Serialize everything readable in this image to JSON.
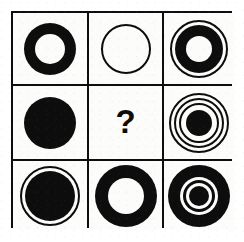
{
  "puzzle": {
    "title": "Matrix Reasoning Puzzle",
    "grid": {
      "rows": 3,
      "columns": 3
    },
    "missing_cell_index": 4,
    "missing_marker": "?",
    "colors": {
      "ink": "#0d0d0d",
      "paper": "#fcfcfa",
      "border": "#0d0d0d"
    },
    "cells": [
      {
        "index": 0,
        "row": 1,
        "column": 1,
        "name": "thick-ring",
        "description": "Thick black annulus with white center",
        "rings": [
          {
            "r": 26,
            "fill": "#0d0d0d",
            "stroke": "none",
            "stroke_width": 0
          },
          {
            "r": 15,
            "fill": "#fcfcfa",
            "stroke": "none",
            "stroke_width": 0
          }
        ]
      },
      {
        "index": 1,
        "row": 1,
        "column": 2,
        "name": "thin-outline-circle",
        "description": "Thin outlined white circle",
        "rings": [
          {
            "r": 24,
            "fill": "#fcfcfa",
            "stroke": "#0d0d0d",
            "stroke_width": 2
          }
        ]
      },
      {
        "index": 2,
        "row": 1,
        "column": 3,
        "name": "outline-plus-thick-ring",
        "description": "Thin outer ring enclosing a thick black annulus with white center",
        "rings": [
          {
            "r": 28,
            "fill": "#fcfcfa",
            "stroke": "#0d0d0d",
            "stroke_width": 2
          },
          {
            "r": 24,
            "fill": "#0d0d0d",
            "stroke": "none",
            "stroke_width": 0
          },
          {
            "r": 13,
            "fill": "#fcfcfa",
            "stroke": "none",
            "stroke_width": 0
          }
        ]
      },
      {
        "index": 3,
        "row": 2,
        "column": 1,
        "name": "solid-disc",
        "description": "Solid black filled circle",
        "rings": [
          {
            "r": 26,
            "fill": "#0d0d0d",
            "stroke": "none",
            "stroke_width": 0
          }
        ]
      },
      {
        "index": 4,
        "row": 2,
        "column": 2,
        "name": "question-mark",
        "description": "Missing element marked with a question mark",
        "rings": []
      },
      {
        "index": 5,
        "row": 2,
        "column": 3,
        "name": "triple-outline-dot",
        "description": "Three thin concentric rings around a solid black center disc",
        "rings": [
          {
            "r": 29,
            "fill": "#fcfcfa",
            "stroke": "#0d0d0d",
            "stroke_width": 2
          },
          {
            "r": 24,
            "fill": "#fcfcfa",
            "stroke": "#0d0d0d",
            "stroke_width": 2
          },
          {
            "r": 19,
            "fill": "#fcfcfa",
            "stroke": "#0d0d0d",
            "stroke_width": 2
          },
          {
            "r": 13,
            "fill": "#0d0d0d",
            "stroke": "none",
            "stroke_width": 0
          }
        ]
      },
      {
        "index": 6,
        "row": 3,
        "column": 1,
        "name": "outline-plus-solid-disc",
        "description": "Thin outer ring enclosing a large solid black disc",
        "rings": [
          {
            "r": 29,
            "fill": "#fcfcfa",
            "stroke": "#0d0d0d",
            "stroke_width": 2
          },
          {
            "r": 25,
            "fill": "#0d0d0d",
            "stroke": "none",
            "stroke_width": 0
          }
        ]
      },
      {
        "index": 7,
        "row": 3,
        "column": 2,
        "name": "large-thick-ring",
        "description": "Large thick black annulus with white center",
        "rings": [
          {
            "r": 31,
            "fill": "#0d0d0d",
            "stroke": "none",
            "stroke_width": 0
          },
          {
            "r": 18,
            "fill": "#fcfcfa",
            "stroke": "none",
            "stroke_width": 0
          }
        ]
      },
      {
        "index": 8,
        "row": 3,
        "column": 3,
        "name": "bullseye",
        "description": "Large black disc with a white ring, thin black ring and small black center dot",
        "rings": [
          {
            "r": 31,
            "fill": "#0d0d0d",
            "stroke": "none",
            "stroke_width": 0
          },
          {
            "r": 19,
            "fill": "#fcfcfa",
            "stroke": "none",
            "stroke_width": 0
          },
          {
            "r": 16,
            "fill": "#0d0d0d",
            "stroke": "none",
            "stroke_width": 0
          },
          {
            "r": 13,
            "fill": "#fcfcfa",
            "stroke": "none",
            "stroke_width": 0
          },
          {
            "r": 10,
            "fill": "#0d0d0d",
            "stroke": "none",
            "stroke_width": 0
          }
        ]
      }
    ]
  }
}
